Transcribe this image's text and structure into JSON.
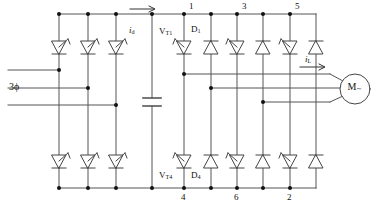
{
  "diagram": {
    "type": "power-electronics-schematic",
    "colors": {
      "wire": "#555555",
      "device_outline": "#444444",
      "node_dot": "#111111",
      "background": "#ffffff",
      "text": "#111111"
    }
  },
  "labels": {
    "source": "3ϕ",
    "dc_current": "i",
    "dc_current_sub": "d",
    "load_current": "i",
    "load_current_sub": "L",
    "thyristor_top": "V",
    "thyristor_top_sub": "T1",
    "thyristor_bottom": "V",
    "thyristor_bottom_sub": "T4",
    "diode_top": "D",
    "diode_top_sub": "1",
    "diode_bottom": "D",
    "diode_bottom_sub": "4",
    "motor": "M",
    "motor_sub": "∼"
  },
  "nodes": {
    "top_rail": [
      {
        "id": "1",
        "label": "1",
        "x": 184
      },
      {
        "id": "3",
        "label": "3",
        "x": 237
      },
      {
        "id": "5",
        "label": "5",
        "x": 290
      }
    ],
    "bottom_rail": [
      {
        "id": "4",
        "label": "4",
        "x": 184
      },
      {
        "id": "6",
        "label": "6",
        "x": 237
      },
      {
        "id": "2",
        "label": "2",
        "x": 290
      }
    ]
  },
  "rectifier": {
    "name": "three-phase-thyristor-rectifier",
    "branch_x": [
      59,
      88,
      116
    ],
    "upper_devices": [
      "thyristor",
      "thyristor",
      "thyristor"
    ],
    "lower_devices": [
      "thyristor",
      "thyristor",
      "thyristor"
    ],
    "input_phases": 3
  },
  "dc_link": {
    "name": "dc-link-capacitor",
    "x": 152,
    "component": "capacitor"
  },
  "inverter": {
    "name": "three-phase-inverter-bridge",
    "branch_x": [
      184,
      211,
      237,
      263,
      290,
      316
    ],
    "upper_devices": [
      "thyristor",
      "diode",
      "thyristor",
      "diode",
      "thyristor",
      "diode"
    ],
    "lower_devices": [
      "thyristor",
      "diode",
      "thyristor",
      "diode",
      "thyristor",
      "diode"
    ],
    "output_phases": 3
  },
  "motor": {
    "name": "ac-motor",
    "cx": 355,
    "cy": 89,
    "r": 15
  },
  "rails": {
    "top_y": 14,
    "bottom_y": 188,
    "phase_in_y": [
      70,
      88,
      105
    ],
    "phase_out_y": [
      74,
      88,
      102
    ]
  }
}
